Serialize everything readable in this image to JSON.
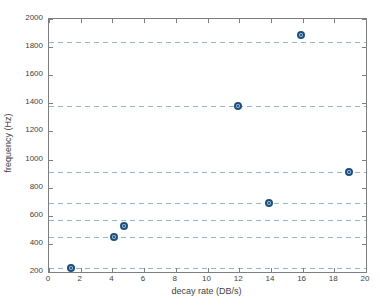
{
  "chart_data": {
    "type": "scatter",
    "title": "",
    "xlabel": "decay rate (DB/s)",
    "ylabel": "frequency (Hz)",
    "xlim": [
      0,
      20
    ],
    "ylim": [
      200,
      2000
    ],
    "xticks": [
      0,
      2,
      4,
      6,
      8,
      10,
      12,
      14,
      16,
      18,
      20
    ],
    "yticks": [
      200,
      400,
      600,
      800,
      1000,
      1200,
      1400,
      1600,
      1800,
      2000
    ],
    "grid": "horizontal-dashed-lines-only",
    "legend": "none",
    "dashed_lines_y": [
      230,
      450,
      568,
      690,
      915,
      1380,
      1835
    ],
    "points": [
      {
        "x": 1.4,
        "y": 230
      },
      {
        "x": 4.1,
        "y": 450
      },
      {
        "x": 4.75,
        "y": 528
      },
      {
        "x": 11.9,
        "y": 1380
      },
      {
        "x": 13.9,
        "y": 690
      },
      {
        "x": 15.9,
        "y": 1885
      },
      {
        "x": 18.9,
        "y": 915
      }
    ],
    "colors": {
      "marker_edge": "#1d4f7c",
      "marker_fill": "#a6c4da",
      "dashed_line": "#93b5cb",
      "axis": "#7f7f7f",
      "text": "#3f3f3f",
      "background": "#ffffff"
    }
  }
}
